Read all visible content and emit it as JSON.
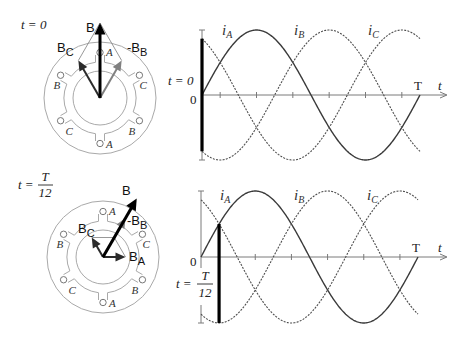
{
  "panels": [
    {
      "time_label": {
        "text": "t = 0"
      },
      "stator": {
        "conductors": [
          {
            "phase": "A"
          },
          {
            "phase": "B"
          },
          {
            "phase": "C"
          },
          {
            "phase": "A"
          },
          {
            "phase": "B"
          },
          {
            "phase": "C"
          }
        ],
        "vectors": [
          {
            "id": "BC",
            "label": "B",
            "sub": "C",
            "magnitude": 0.866,
            "angle_deg": 120,
            "color": "#2b2b2b"
          },
          {
            "id": "negBB",
            "label": "-B",
            "sub": "B",
            "magnitude": 0.866,
            "angle_deg": 60,
            "color": "#808080"
          },
          {
            "id": "B",
            "label": "B",
            "sub": "",
            "magnitude": 1.5,
            "angle_deg": 90,
            "color": "#000000"
          }
        ],
        "construction_lines": [
          {
            "from": [
              "BC"
            ],
            "to": [
              "BC",
              "negBB"
            ]
          },
          {
            "from": [
              "negBB"
            ],
            "to": [
              "BC",
              "negBB"
            ]
          }
        ]
      }
    },
    {
      "time_label": {
        "prefix": "t =",
        "numerator": "T",
        "denominator": "12"
      },
      "stator": {
        "conductors": [
          {
            "phase": "A"
          },
          {
            "phase": "B"
          },
          {
            "phase": "C"
          },
          {
            "phase": "A"
          },
          {
            "phase": "B"
          },
          {
            "phase": "C"
          }
        ],
        "vectors": [
          {
            "id": "negBB",
            "label": "-B",
            "sub": "B",
            "magnitude": 1.0,
            "angle_deg": 60,
            "color": "#808080"
          },
          {
            "id": "BC",
            "label": "B",
            "sub": "C",
            "magnitude": 0.5,
            "angle_deg": 120,
            "color": "#2b2b2b"
          },
          {
            "id": "BA",
            "label": "B",
            "sub": "A",
            "magnitude": 0.5,
            "angle_deg": 0,
            "color": "#2b2b2b"
          },
          {
            "id": "B",
            "label": "B",
            "sub": "",
            "magnitude": 1.5,
            "angle_deg": 60,
            "color": "#000000"
          }
        ],
        "construction_lines": [
          {
            "from": [
              "BC"
            ],
            "to": [
              "BC",
              "BA"
            ]
          },
          {
            "from": [
              "BA"
            ],
            "to": [
              "BC",
              "BA"
            ]
          }
        ]
      }
    }
  ],
  "chart_data": [
    {
      "type": "line",
      "title": "",
      "xlabel": "t",
      "x_end_label": "T",
      "origin_label": "0",
      "ylabel": "",
      "x_unit": "T",
      "xlim": [
        0,
        1
      ],
      "ylim": [
        -1,
        1
      ],
      "grid": false,
      "x_ticks": [
        0.0833,
        0.25,
        0.4167,
        0.5833,
        0.75,
        0.9167
      ],
      "x": [
        0,
        0.0833,
        0.1667,
        0.25,
        0.3333,
        0.4167,
        0.5,
        0.5833,
        0.6667,
        0.75,
        0.8333,
        0.9167,
        1
      ],
      "series": [
        {
          "name": "i_A",
          "label": "i",
          "sub": "A",
          "amplitude": 1,
          "phase_deg": 0,
          "style": "solid",
          "color": "#3a3a3a",
          "values": [
            0,
            0.5,
            0.866,
            1,
            0.866,
            0.5,
            0,
            -0.5,
            -0.866,
            -1,
            -0.866,
            -0.5,
            0
          ]
        },
        {
          "name": "i_B",
          "label": "i",
          "sub": "B",
          "amplitude": 1,
          "phase_deg": -120,
          "style": "dotted",
          "color": "#4d4d4d",
          "values": [
            -0.866,
            -1,
            -0.866,
            -0.5,
            0,
            0.5,
            0.866,
            1,
            0.866,
            0.5,
            0,
            -0.5,
            -0.866
          ]
        },
        {
          "name": "i_C",
          "label": "i",
          "sub": "C",
          "amplitude": 1,
          "phase_deg": 120,
          "style": "dotted",
          "color": "#4d4d4d",
          "values": [
            0.866,
            0.5,
            0,
            -0.5,
            -0.866,
            -1,
            -0.866,
            -0.5,
            0,
            0.5,
            0.866,
            1,
            0.866
          ]
        }
      ],
      "marker": {
        "t_over_T": 0,
        "label": "t = 0",
        "color": "#000000"
      }
    },
    {
      "type": "line",
      "title": "",
      "xlabel": "t",
      "x_end_label": "T",
      "origin_label": "0",
      "ylabel": "",
      "x_unit": "T",
      "xlim": [
        0,
        1
      ],
      "ylim": [
        -1,
        1
      ],
      "grid": false,
      "x_ticks": [
        0.0833,
        0.25,
        0.4167,
        0.5833,
        0.75,
        0.9167
      ],
      "x": [
        0,
        0.0833,
        0.1667,
        0.25,
        0.3333,
        0.4167,
        0.5,
        0.5833,
        0.6667,
        0.75,
        0.8333,
        0.9167,
        1
      ],
      "series": [
        {
          "name": "i_A",
          "label": "i",
          "sub": "A",
          "amplitude": 1,
          "phase_deg": 0,
          "style": "solid",
          "color": "#3a3a3a",
          "values": [
            0,
            0.5,
            0.866,
            1,
            0.866,
            0.5,
            0,
            -0.5,
            -0.866,
            -1,
            -0.866,
            -0.5,
            0
          ]
        },
        {
          "name": "i_B",
          "label": "i",
          "sub": "B",
          "amplitude": 1,
          "phase_deg": -120,
          "style": "dotted",
          "color": "#4d4d4d",
          "values": [
            -0.866,
            -1,
            -0.866,
            -0.5,
            0,
            0.5,
            0.866,
            1,
            0.866,
            0.5,
            0,
            -0.5,
            -0.866
          ]
        },
        {
          "name": "i_C",
          "label": "i",
          "sub": "C",
          "amplitude": 1,
          "phase_deg": 120,
          "style": "dotted",
          "color": "#4d4d4d",
          "values": [
            0.866,
            0.5,
            0,
            -0.5,
            -0.866,
            -1,
            -0.866,
            -0.5,
            0,
            0.5,
            0.866,
            1,
            0.866
          ]
        }
      ],
      "marker": {
        "t_over_T": 0.0833,
        "label_prefix": "t =",
        "label_numerator": "T",
        "label_denominator": "12",
        "color": "#000000"
      }
    }
  ]
}
